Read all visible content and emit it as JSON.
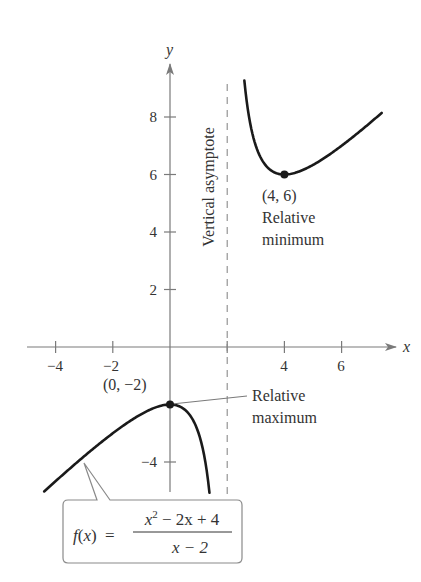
{
  "chart_data": {
    "type": "line",
    "title": "",
    "function": "f(x) = (x^2 - 2x + 4)/(x - 2)",
    "xlabel": "x",
    "ylabel": "y",
    "xlim": [
      -5,
      8
    ],
    "ylim": [
      -6,
      10
    ],
    "grid": false,
    "x_ticks": [
      -4,
      -2,
      4,
      6
    ],
    "x_tick_labels": [
      "−4",
      "−2",
      "4",
      "6"
    ],
    "x_tick_marks": [
      -4,
      -2,
      2,
      4,
      6
    ],
    "y_ticks": [
      8,
      6,
      4,
      2,
      -4
    ],
    "y_tick_labels": [
      "8",
      "6",
      "4",
      "2",
      "−4"
    ],
    "series": [
      {
        "name": "left branch",
        "x_range": [
          -4.4,
          1.38
        ],
        "points": [
          [
            -4.4,
            -5.03
          ],
          [
            -3,
            -3.8
          ],
          [
            -2,
            -3.0
          ],
          [
            -1,
            -2.33
          ],
          [
            0,
            -2.0
          ],
          [
            0.5,
            -2.17
          ],
          [
            1,
            -3.0
          ],
          [
            1.2,
            -3.8
          ],
          [
            1.38,
            -4.84
          ]
        ]
      },
      {
        "name": "right branch",
        "x_range": [
          2.6,
          7.4
        ],
        "points": [
          [
            2.6,
            9.27
          ],
          [
            3,
            7.0
          ],
          [
            3.5,
            6.17
          ],
          [
            4,
            6.0
          ],
          [
            5,
            6.33
          ],
          [
            6,
            7.0
          ],
          [
            7,
            7.8
          ],
          [
            7.4,
            8.14
          ]
        ]
      }
    ],
    "asymptote": {
      "x": 2,
      "label": "Vertical asymptote",
      "style": "dashed"
    },
    "points": [
      {
        "x": 4,
        "y": 6,
        "label": "(4, 6)",
        "note_line1": "Relative",
        "note_line2": "minimum"
      },
      {
        "x": 0,
        "y": -2,
        "label": "(0, −2)",
        "note_line1": "Relative",
        "note_line2": "maximum"
      }
    ],
    "callout": {
      "lhs": "f(x) =",
      "numerator": "x² − 2x + 4",
      "denominator": "x − 2"
    },
    "colors": {
      "curve": "#1a1a1a",
      "axis": "#7a7a7a",
      "text": "#333333",
      "callout_border": "#8a8a8a"
    }
  },
  "labels": {
    "x_axis": "x",
    "y_axis": "y",
    "tick_x_m4": "−4",
    "tick_x_m2": "−2",
    "tick_x_4": "4",
    "tick_x_6": "6",
    "tick_y_8": "8",
    "tick_y_6": "6",
    "tick_y_4": "4",
    "tick_y_2": "2",
    "tick_y_m4": "−4",
    "asymptote": "Vertical asymptote",
    "min_point": "(4, 6)",
    "min_line1": "Relative",
    "min_line2": "minimum",
    "max_point": "(0, −2)",
    "max_line1": "Relative",
    "max_line2": "maximum",
    "formula_f": "f",
    "formula_paren_open": "(",
    "formula_x": "x",
    "formula_paren_close": ")",
    "formula_eq": "=",
    "num_x": "x",
    "num_exp": "2",
    "num_rest": " − 2x + 4",
    "den": "x − 2"
  }
}
